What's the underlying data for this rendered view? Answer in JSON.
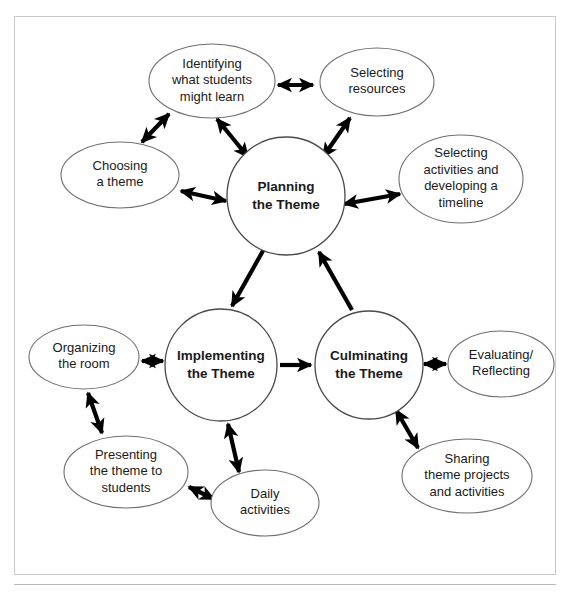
{
  "figure": {
    "clipped_header_text": "",
    "border_color": "#c9c9c9",
    "arrow_color": "#000000",
    "shape_stroke_color": "#6f6f6f",
    "background_color": "#ffffff"
  },
  "core_nodes": [
    {
      "id": "planning",
      "label_lines": [
        "Planning",
        "the Theme"
      ],
      "line1": "Planning",
      "line2": "the Theme",
      "shape": "circle",
      "cx": 272,
      "cy": 180,
      "r": 59,
      "bold": true
    },
    {
      "id": "implementing",
      "label_lines": [
        "Implementing",
        "the Theme"
      ],
      "line1": "Implementing",
      "line2": "the Theme",
      "shape": "circle",
      "cx": 207,
      "cy": 349,
      "r": 56,
      "bold": true
    },
    {
      "id": "culminating",
      "label_lines": [
        "Culminating",
        "the Theme"
      ],
      "line1": "Culminating",
      "line2": "the Theme",
      "shape": "circle",
      "cx": 355,
      "cy": 349,
      "r": 54,
      "bold": true
    }
  ],
  "satellite_nodes": [
    {
      "id": "identifying",
      "label_lines": [
        "Identifying",
        "what students",
        "might learn"
      ],
      "line1": "Identifying",
      "line2": "what students",
      "line3": "might learn",
      "shape": "ellipse",
      "cx": 198,
      "cy": 65,
      "rx": 63,
      "ry": 37,
      "parent": "planning"
    },
    {
      "id": "selecting-resources",
      "label_lines": [
        "Selecting",
        "resources"
      ],
      "line1": "Selecting",
      "line2": "resources",
      "shape": "ellipse",
      "cx": 363,
      "cy": 66,
      "rx": 57,
      "ry": 34,
      "parent": "planning"
    },
    {
      "id": "choosing-theme",
      "label_lines": [
        "Choosing",
        "a theme"
      ],
      "line1": "Choosing",
      "line2": "a theme",
      "shape": "ellipse",
      "cx": 106,
      "cy": 159,
      "rx": 59,
      "ry": 33,
      "parent": "planning"
    },
    {
      "id": "selecting-activities",
      "label_lines": [
        "Selecting",
        "activities and",
        "developing a",
        "timeline"
      ],
      "line1": "Selecting",
      "line2": "activities and",
      "line3": "developing a",
      "line4": "timeline",
      "shape": "ellipse",
      "cx": 447,
      "cy": 163,
      "rx": 62,
      "ry": 44,
      "parent": "planning"
    },
    {
      "id": "organizing-room",
      "label_lines": [
        "Organizing",
        "the room"
      ],
      "line1": "Organizing",
      "line2": "the room",
      "shape": "ellipse",
      "cx": 70,
      "cy": 341,
      "rx": 55,
      "ry": 32,
      "parent": "implementing"
    },
    {
      "id": "presenting-theme",
      "label_lines": [
        "Presenting",
        "the theme to",
        "students"
      ],
      "line1": "Presenting",
      "line2": "the theme to",
      "line3": "students",
      "shape": "ellipse",
      "cx": 112,
      "cy": 456,
      "rx": 62,
      "ry": 36,
      "parent": "implementing"
    },
    {
      "id": "daily-activities",
      "label_lines": [
        "Daily",
        "activities"
      ],
      "line1": "Daily",
      "line2": "activities",
      "shape": "ellipse",
      "cx": 251,
      "cy": 487,
      "rx": 54,
      "ry": 33,
      "parent": "implementing"
    },
    {
      "id": "evaluating-reflecting",
      "label_lines": [
        "Evaluating/",
        "Reflecting"
      ],
      "line1": "Evaluating/",
      "line2": "Reflecting",
      "shape": "ellipse",
      "cx": 487,
      "cy": 348,
      "rx": 53,
      "ry": 33,
      "parent": "culminating"
    },
    {
      "id": "sharing-theme",
      "label_lines": [
        "Sharing",
        "theme projects",
        "and activities"
      ],
      "line1": "Sharing",
      "line2": "theme projects",
      "line3": "and activities",
      "shape": "ellipse",
      "cx": 453,
      "cy": 460,
      "rx": 65,
      "ry": 37,
      "parent": "culminating"
    }
  ],
  "connectors": [
    {
      "id": "identifying-to-resources",
      "from": "identifying",
      "to": "selecting-resources",
      "style": "double",
      "x1": 264,
      "y1": 69,
      "x2": 299,
      "y2": 69
    },
    {
      "id": "choosing-to-identifying",
      "from": "choosing-theme",
      "to": "identifying",
      "style": "double",
      "x1": 128,
      "y1": 126,
      "x2": 155,
      "y2": 98
    },
    {
      "id": "identifying-to-planning",
      "from": "identifying",
      "to": "planning",
      "style": "double",
      "x1": 203,
      "y1": 103,
      "x2": 234,
      "y2": 141
    },
    {
      "id": "resources-to-planning",
      "from": "selecting-resources",
      "to": "planning",
      "style": "double",
      "x1": 336,
      "y1": 102,
      "x2": 309,
      "y2": 141
    },
    {
      "id": "choosing-to-planning",
      "from": "choosing-theme",
      "to": "planning",
      "style": "double",
      "x1": 167,
      "y1": 175,
      "x2": 212,
      "y2": 185
    },
    {
      "id": "activities-to-planning",
      "from": "selecting-activities",
      "to": "planning",
      "style": "double",
      "x1": 386,
      "y1": 178,
      "x2": 330,
      "y2": 188
    },
    {
      "id": "planning-to-implementing",
      "from": "planning",
      "to": "implementing",
      "style": "single",
      "x1": 250,
      "y1": 233,
      "x2": 218,
      "y2": 290
    },
    {
      "id": "implementing-to-culminating",
      "from": "implementing",
      "to": "culminating",
      "style": "single",
      "x1": 266,
      "y1": 349,
      "x2": 297,
      "y2": 349
    },
    {
      "id": "culminating-to-planning",
      "from": "culminating",
      "to": "planning",
      "style": "single",
      "x1": 338,
      "y1": 294,
      "x2": 305,
      "y2": 236
    },
    {
      "id": "organizing-to-implementing",
      "from": "organizing-room",
      "to": "implementing",
      "style": "double",
      "x1": 128,
      "y1": 345,
      "x2": 149,
      "y2": 345
    },
    {
      "id": "presenting-to-organizing",
      "from": "presenting-theme",
      "to": "organizing-room",
      "style": "double",
      "x1": 88,
      "y1": 417,
      "x2": 74,
      "y2": 377
    },
    {
      "id": "presenting-to-daily",
      "from": "presenting-theme",
      "to": "daily-activities",
      "style": "double",
      "x1": 175,
      "y1": 471,
      "x2": 200,
      "y2": 483
    },
    {
      "id": "daily-to-implementing",
      "from": "daily-activities",
      "to": "implementing",
      "style": "double",
      "x1": 225,
      "y1": 456,
      "x2": 214,
      "y2": 408
    },
    {
      "id": "culminating-to-evaluating",
      "from": "culminating",
      "to": "evaluating-reflecting",
      "style": "double",
      "x1": 410,
      "y1": 348,
      "x2": 432,
      "y2": 348
    },
    {
      "id": "sharing-to-culminating",
      "from": "sharing-theme",
      "to": "culminating",
      "style": "double",
      "x1": 404,
      "y1": 432,
      "x2": 382,
      "y2": 394
    }
  ]
}
